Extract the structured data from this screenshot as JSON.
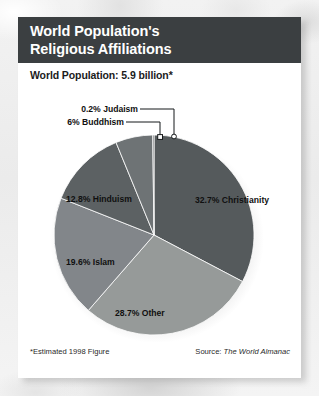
{
  "title": {
    "line1": "World Population's",
    "line2": "Religious Affiliations"
  },
  "subtitle": "World Population: 5.9 billion*",
  "footer": {
    "footnote": "*Estimated 1998 Figure",
    "source_label": "Source: ",
    "source_title": "The World Almanac"
  },
  "colors": {
    "header_bg": "#3b3f41",
    "card_bg": "#ffffff",
    "page_bg": "#efefef",
    "christianity": "#555a5c",
    "other": "#969a99",
    "islam": "#82868a",
    "hinduism": "#5c6163",
    "buddhism": "#6e7375",
    "judaism": "#45494b",
    "label_text": "#101010",
    "leader_line": "#15181a"
  },
  "chart_data": {
    "type": "pie",
    "title": "World Population's Religious Affiliations",
    "subtitle": "World Population: 5.9 billion*",
    "unit": "percent",
    "total_population": "5.9 billion",
    "legend": "none",
    "start_angle_deg": 0,
    "direction": "clockwise",
    "categories": [
      "Christianity",
      "Other",
      "Islam",
      "Hinduism",
      "Buddhism",
      "Judaism"
    ],
    "values": [
      32.7,
      28.7,
      19.6,
      12.8,
      6.0,
      0.2
    ],
    "labels": [
      "32.7% Christianity",
      "28.7% Other",
      "19.6% Islam",
      "12.8% Hinduism",
      "6% Buddhism",
      "0.2% Judaism"
    ],
    "slices": [
      {
        "name": "Christianity",
        "value": 32.7,
        "label": "32.7% Christianity",
        "color": "#555a5c",
        "label_placement": "inside"
      },
      {
        "name": "Other",
        "value": 28.7,
        "label": "28.7% Other",
        "color": "#969a99",
        "label_placement": "inside"
      },
      {
        "name": "Islam",
        "value": 19.6,
        "label": "19.6% Islam",
        "color": "#82868a",
        "label_placement": "inside"
      },
      {
        "name": "Hinduism",
        "value": 12.8,
        "label": "12.8% Hinduism",
        "color": "#5c6163",
        "label_placement": "inside"
      },
      {
        "name": "Buddhism",
        "value": 6.0,
        "label": "6% Buddhism",
        "color": "#6e7375",
        "label_placement": "callout"
      },
      {
        "name": "Judaism",
        "value": 0.2,
        "label": "0.2% Judaism",
        "color": "#45494b",
        "label_placement": "callout"
      }
    ],
    "annotations": [
      "*Estimated 1998 Figure",
      "Source: The World Almanac"
    ]
  }
}
